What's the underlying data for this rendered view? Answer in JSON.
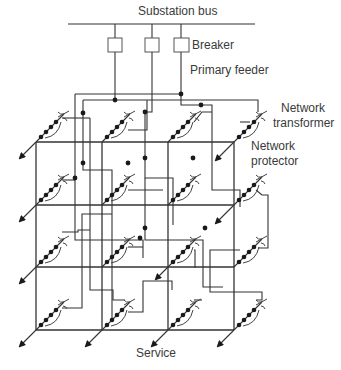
{
  "diagram": {
    "labels": {
      "substation_bus": "Substation bus",
      "breaker": "Breaker",
      "primary_feeder": "Primary feeder",
      "network_transformer_line1": "Network",
      "network_transformer_line2": "transformer",
      "network_protector_line1": "Network",
      "network_protector_line2": "protector",
      "service": "Service"
    },
    "components": {
      "breakers": 3,
      "primary_feeders": 3,
      "network_transformers": 16,
      "grid_rows": 4,
      "grid_columns": 4
    },
    "colors": {
      "line": "#333333",
      "text": "#3a3a3a",
      "background": "#ffffff"
    }
  }
}
